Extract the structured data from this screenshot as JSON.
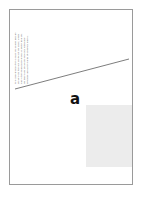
{
  "document": {
    "page_label": "document-page-thumbnail",
    "background_color": "#ffffff",
    "page_border_color": "#9a9a9a"
  },
  "caption": {
    "name": "figure-caption-rotated",
    "lines": [
      "The coordinates of the dots in the scatter plot are",
      "shown here for each subject of the study, where",
      "each of the markers indicates a distinct trial and",
      "the gray band shows the modeled regression",
      "envelope across the range of observed values."
    ]
  },
  "panel": {
    "label": "a"
  },
  "trend_line": {
    "name": "diagonal-trend-line",
    "color": "#6e6e6e",
    "x1": 5,
    "y1": 79,
    "x2": 119,
    "y2": 49
  },
  "figure_block": {
    "name": "gray-image-placeholder",
    "color": "#ececec"
  },
  "chart_data": {
    "type": "line",
    "title": "",
    "subtitle": "",
    "xlabel": "",
    "ylabel": "",
    "series": [
      {
        "name": "trend",
        "x": [
          0,
          100
        ],
        "y": [
          0,
          26
        ]
      }
    ],
    "x": [
      0,
      100
    ],
    "xlim": [
      0,
      100
    ],
    "ylim": [
      0,
      100
    ],
    "grid": false,
    "legend": "none",
    "annotations": [
      "a"
    ]
  }
}
